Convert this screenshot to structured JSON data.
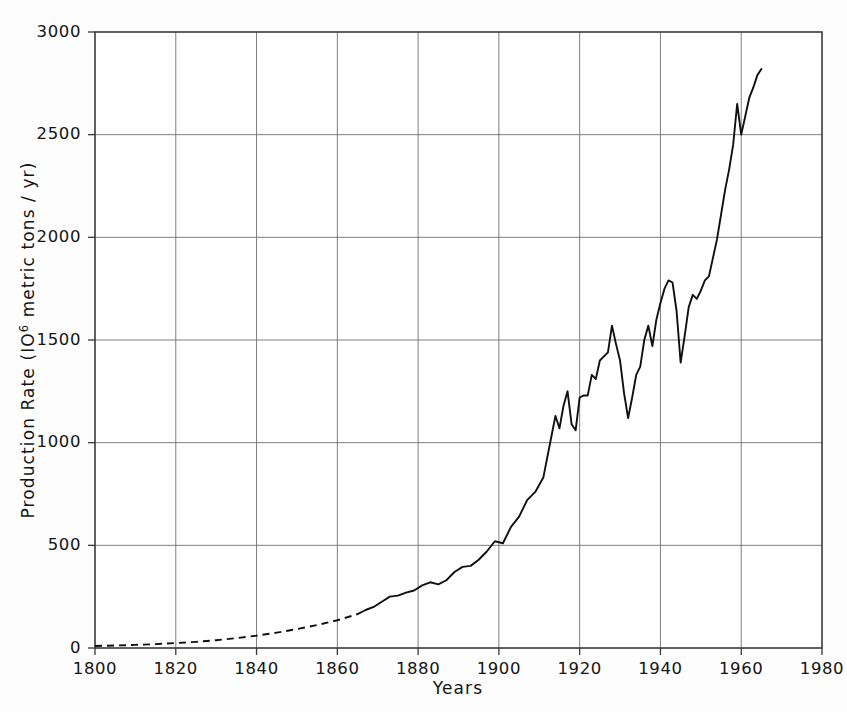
{
  "chart_data": {
    "type": "line",
    "title": "",
    "subtitle": "",
    "xlabel": "Years",
    "ylabel": "Production Rate (10⁶ metric tons / yr)",
    "ylabel_parts": {
      "prefix": "Production Rate (IO",
      "superscript": "6",
      "suffix": " metric tons / yr)"
    },
    "xlim": [
      1800,
      1980
    ],
    "ylim": [
      0,
      3000
    ],
    "xticks": [
      1800,
      1820,
      1840,
      1860,
      1880,
      1900,
      1920,
      1940,
      1960,
      1980
    ],
    "yticks": [
      0,
      500,
      1000,
      1500,
      2000,
      2500,
      3000
    ],
    "xtick_labels": [
      "1800",
      "1820",
      "1840",
      "1860",
      "1880",
      "1900",
      "1920",
      "1940",
      "1960",
      "1980"
    ],
    "ytick_labels": [
      "0",
      "500",
      "1000",
      "1500",
      "2000",
      "2500",
      "3000"
    ],
    "grid": true,
    "legend": "none",
    "line_color": "#101010",
    "grid_color": "#6f6f6f",
    "frame_color": "#3a3a3a",
    "background_color": "#fdfdfd",
    "series": [
      {
        "name": "Production Rate",
        "style": "dashed",
        "note": "estimated / extrapolated segment",
        "x": [
          1800,
          1805,
          1810,
          1815,
          1820,
          1825,
          1830,
          1835,
          1840,
          1845,
          1850,
          1855,
          1860,
          1865
        ],
        "y": [
          10,
          12,
          15,
          19,
          24,
          30,
          38,
          48,
          60,
          75,
          92,
          112,
          135,
          165
        ]
      },
      {
        "name": "Production Rate",
        "style": "solid",
        "note": "measured segment",
        "x": [
          1865,
          1867,
          1869,
          1871,
          1873,
          1875,
          1877,
          1879,
          1881,
          1883,
          1885,
          1887,
          1889,
          1891,
          1893,
          1895,
          1897,
          1899,
          1901,
          1903,
          1905,
          1907,
          1909,
          1911,
          1913,
          1914,
          1915,
          1916,
          1917,
          1918,
          1919,
          1920,
          1921,
          1922,
          1923,
          1924,
          1925,
          1926,
          1927,
          1928,
          1929,
          1930,
          1931,
          1932,
          1933,
          1934,
          1935,
          1936,
          1937,
          1938,
          1939,
          1940,
          1941,
          1942,
          1943,
          1944,
          1945,
          1946,
          1947,
          1948,
          1949,
          1950,
          1951,
          1952,
          1953,
          1954,
          1955,
          1956,
          1957,
          1958,
          1959,
          1960,
          1961,
          1962,
          1963,
          1964,
          1965
        ],
        "y": [
          165,
          185,
          200,
          225,
          250,
          255,
          270,
          280,
          305,
          320,
          310,
          330,
          370,
          395,
          400,
          430,
          470,
          520,
          510,
          590,
          640,
          720,
          760,
          830,
          1030,
          1130,
          1070,
          1180,
          1250,
          1090,
          1060,
          1220,
          1230,
          1230,
          1330,
          1310,
          1400,
          1420,
          1440,
          1570,
          1480,
          1400,
          1240,
          1120,
          1220,
          1330,
          1370,
          1500,
          1570,
          1470,
          1600,
          1680,
          1750,
          1790,
          1780,
          1640,
          1390,
          1520,
          1660,
          1720,
          1700,
          1740,
          1790,
          1810,
          1900,
          1990,
          2110,
          2230,
          2330,
          2450,
          2650,
          2500,
          2590,
          2680,
          2730,
          2790,
          2820
        ]
      }
    ],
    "annotations": [
      {
        "text": "dashed line indicates extrapolated early production",
        "visible": false
      }
    ]
  },
  "axes": {
    "y_title_prefix": "Production Rate (IO",
    "y_title_sup": "6",
    "y_title_suffix": " metric tons / yr)",
    "x_title": "Years"
  }
}
